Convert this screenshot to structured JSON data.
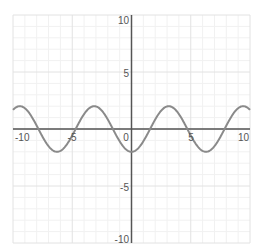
{
  "chart_data": {
    "type": "line",
    "title": "",
    "xlabel": "",
    "ylabel": "",
    "xlim": [
      -10,
      10
    ],
    "ylim": [
      -10,
      10
    ],
    "grid": true,
    "grid_minor_step": 1,
    "grid_major_step": 5,
    "legend": null,
    "x_tick_labels": [
      "-10",
      "-5",
      "0",
      "5",
      "10"
    ],
    "y_tick_labels": [
      "10",
      "5",
      "-5",
      "-10"
    ],
    "series": [
      {
        "name": "y = -2cos(x)",
        "expression": "-2*cos(x)",
        "amplitude": 2,
        "period": 6.283,
        "color": "#8a8a8a",
        "x": [
          -10,
          -9.42,
          -7.85,
          -6.28,
          -4.71,
          -3.14,
          -1.57,
          0,
          1.57,
          3.14,
          4.71,
          6.28,
          7.85,
          9.42,
          10
        ],
        "y": [
          1.68,
          2,
          0,
          -2,
          0,
          2,
          0,
          -2,
          0,
          2,
          0,
          -2,
          0,
          2,
          1.68
        ]
      }
    ]
  },
  "style": {
    "axis_color": "#555555",
    "grid_major_color": "#e2e2e2",
    "grid_minor_color": "#f1f1f1",
    "curve_color": "#8a8a8a",
    "label_color": "#555555"
  },
  "labels": {
    "x_neg10": "-10",
    "x_neg5": "-5",
    "x_0": "0",
    "x_5": "5",
    "x_10": "10",
    "y_10": "10",
    "y_5": "5",
    "y_neg5": "-5",
    "y_neg10": "-10"
  }
}
